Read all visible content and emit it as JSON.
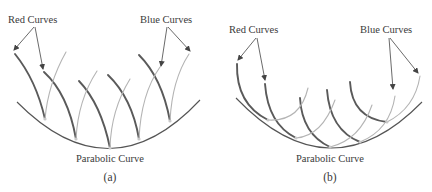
{
  "panels": [
    {
      "id": "a",
      "caption": "(a)",
      "red_label": "Red Curves",
      "blue_label": "Blue Curves",
      "parabola_label": "Parabolic Curve"
    },
    {
      "id": "b",
      "caption": "(b)",
      "red_label": "Red Curves",
      "blue_label": "Blue Curves",
      "parabola_label": "Parabolic Curve"
    }
  ],
  "colors": {
    "red_curves": "#5a5a5a",
    "blue_curves": "#b4b4b4",
    "parabola": "#555555",
    "text": "#3a3a3a",
    "background": "#ffffff"
  }
}
